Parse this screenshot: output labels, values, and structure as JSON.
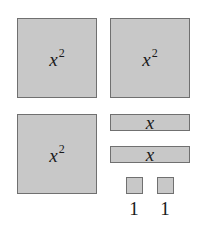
{
  "diagram": {
    "tile_color": "#c8c8c8",
    "border_color": "#707070",
    "square_tiles": [
      {
        "var": "x",
        "exp": "2"
      },
      {
        "var": "x",
        "exp": "2"
      },
      {
        "var": "x",
        "exp": "2"
      }
    ],
    "bar_tiles": [
      {
        "label": "x"
      },
      {
        "label": "x"
      }
    ],
    "unit_tiles": [
      {
        "label": "1"
      },
      {
        "label": "1"
      }
    ]
  }
}
